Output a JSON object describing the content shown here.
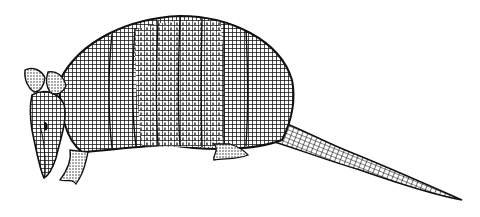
{
  "image": {
    "subject": "armadillo",
    "style": "black-and-white line engraving",
    "background_color": "#ffffff",
    "ink_color": "#111111"
  },
  "parts": {
    "ears": "ears",
    "head": "head",
    "shell": "banded shell",
    "front_leg": "front leg",
    "hind_foot": "hind foot",
    "tail": "tail"
  }
}
